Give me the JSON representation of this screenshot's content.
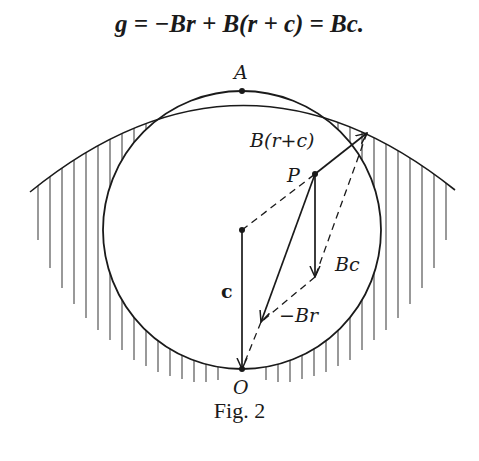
{
  "equation": {
    "text": "g = −Br + B(r + c) = Bc."
  },
  "figure": {
    "caption": "Fig. 2",
    "labels": {
      "A": "A",
      "O": "O",
      "P": "P",
      "B_r_plus_c": "B(r+c)",
      "Bc": "Bc",
      "minus_Br": "−Br",
      "c": "c"
    },
    "points": {
      "A": [
        242,
        91
      ],
      "O": [
        242,
        369
      ],
      "center": [
        242,
        230
      ],
      "P": [
        315,
        174
      ],
      "tip_B_r_plus_c": [
        367,
        133
      ],
      "tip_Bc": [
        315,
        277
      ],
      "tip_minus_Br": [
        261,
        322
      ]
    },
    "circle_radius": 139
  }
}
